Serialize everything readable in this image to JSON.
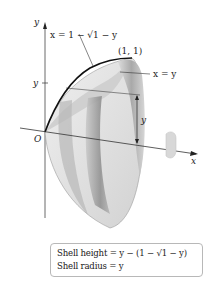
{
  "diagram": {
    "type": "solid of revolution - shell method",
    "axes": {
      "x_label": "x",
      "y_label": "y",
      "origin_label": "O",
      "y_tick_label": "y"
    },
    "curves": [
      {
        "label": "x = 1 − √1 − y",
        "name": "curve"
      },
      {
        "label": "x = y",
        "name": "line"
      }
    ],
    "point_label": "(1, 1)",
    "height_label": "y",
    "rotation_axis": "x"
  },
  "formula_box": {
    "line1": "Shell height = y − (1 − √1 − y)",
    "line2": "Shell radius = y"
  },
  "colors": {
    "surface_light": "#e6e6e6",
    "surface_mid": "#bdbdbd",
    "surface_dark": "#8f8f8f",
    "curve": "#111111",
    "axis": "#333333"
  }
}
